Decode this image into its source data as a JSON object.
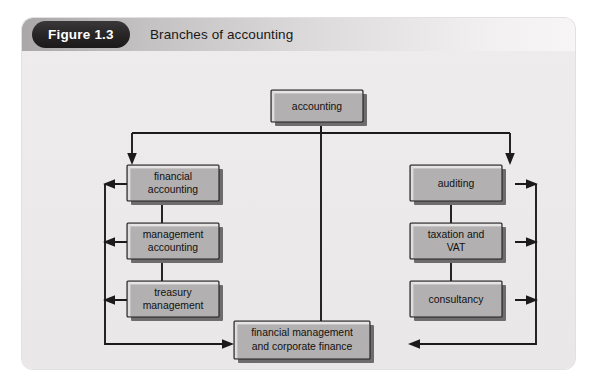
{
  "figure": {
    "badge_label": "Figure 1.3",
    "title": "Branches of accounting"
  },
  "diagram": {
    "type": "hierarchy-flow",
    "root": {
      "id": "accounting",
      "label": "accounting",
      "lines": [
        "accounting"
      ]
    },
    "left_branch": [
      {
        "id": "financial-accounting",
        "lines": [
          "financial",
          "accounting"
        ]
      },
      {
        "id": "management-accounting",
        "lines": [
          "management",
          "accounting"
        ]
      },
      {
        "id": "treasury-management",
        "lines": [
          "treasury",
          "management"
        ]
      }
    ],
    "right_branch": [
      {
        "id": "auditing",
        "lines": [
          "auditing"
        ]
      },
      {
        "id": "taxation-and-vat",
        "lines": [
          "taxation and",
          "VAT"
        ]
      },
      {
        "id": "consultancy",
        "lines": [
          "consultancy"
        ]
      }
    ],
    "bottom": {
      "id": "financial-management-and-corporate-finance",
      "lines": [
        "financial management",
        "and corporate finance"
      ]
    },
    "colors": {
      "box_fill": "#b2b0b0",
      "box_border": "#211f1f",
      "box_shadow": "#6e6c6c",
      "connector": "#1c1a1a",
      "panel_bg": "#eceaea",
      "badge_bg": "#262424",
      "badge_text": "#ffffff"
    }
  }
}
